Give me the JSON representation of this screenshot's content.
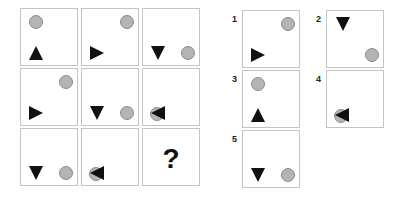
{
  "puzzle": {
    "question_mark": "?",
    "grid": [
      {
        "id": "r1c1",
        "circle": "top-left",
        "triangle": {
          "pos": "bottom-left",
          "dir": "up"
        }
      },
      {
        "id": "r1c2",
        "circle": "top-right",
        "triangle": {
          "pos": "bottom-left",
          "dir": "right"
        }
      },
      {
        "id": "r1c3",
        "circle": "bottom-right",
        "triangle": {
          "pos": "bottom-left",
          "dir": "down"
        }
      },
      {
        "id": "r2c1",
        "circle": "top-right",
        "triangle": {
          "pos": "bottom-left",
          "dir": "right"
        }
      },
      {
        "id": "r2c2",
        "circle": "bottom-right",
        "triangle": {
          "pos": "bottom-left",
          "dir": "down"
        }
      },
      {
        "id": "r2c3",
        "circle": "bottom-left-overlap",
        "triangle": {
          "pos": "bottom-left",
          "dir": "left"
        }
      },
      {
        "id": "r3c1",
        "circle": "bottom-right",
        "triangle": {
          "pos": "bottom-left",
          "dir": "down"
        }
      },
      {
        "id": "r3c2",
        "circle": "bottom-left-overlap",
        "triangle": {
          "pos": "bottom-left",
          "dir": "left"
        }
      },
      {
        "id": "r3c3",
        "missing": true
      }
    ],
    "options": [
      {
        "label": "1",
        "circle": "top-right",
        "triangle": {
          "pos": "bottom-left",
          "dir": "right"
        }
      },
      {
        "label": "2",
        "circle": "bottom-right",
        "triangle": {
          "pos": "top-left",
          "dir": "down"
        }
      },
      {
        "label": "3",
        "circle": "top-left",
        "triangle": {
          "pos": "bottom-left",
          "dir": "up"
        }
      },
      {
        "label": "4",
        "circle": "bottom-left-overlap",
        "triangle": {
          "pos": "bottom-left",
          "dir": "left"
        }
      },
      {
        "label": "5",
        "circle": "bottom-right",
        "triangle": {
          "pos": "bottom-left",
          "dir": "down"
        }
      }
    ]
  }
}
